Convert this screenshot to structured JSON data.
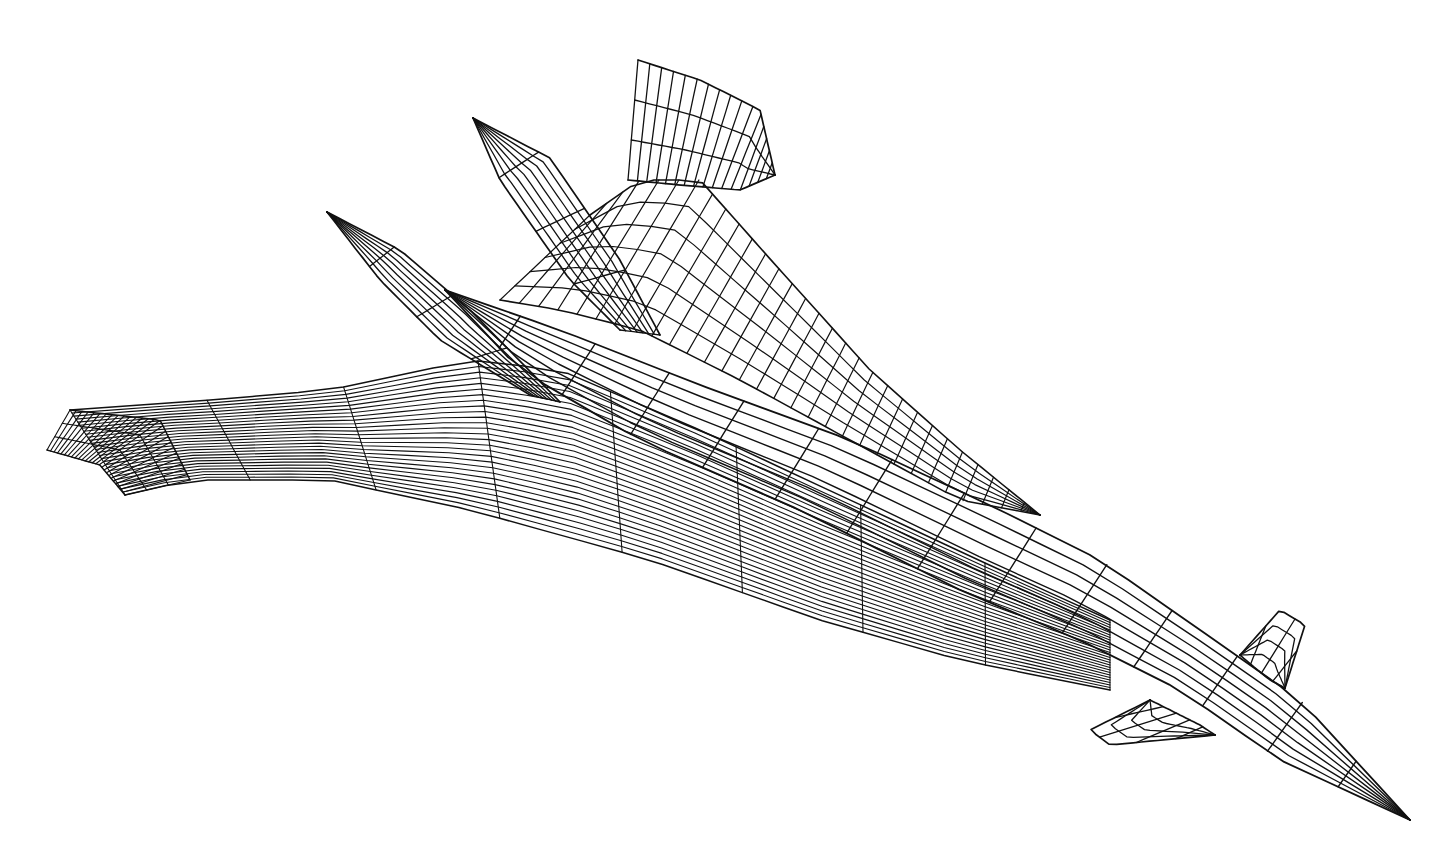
{
  "figure": {
    "background": "#ffffff",
    "stroke_color": "#111111",
    "stroke_width": 1.6,
    "fine_stroke_width": 1.1
  },
  "components": [
    {
      "id": "fuselage",
      "name": "fuselage-mesh",
      "u_lines": 14,
      "v_lines": 7,
      "edgeA": [
        [
          445,
          290
        ],
        [
          560,
          330
        ],
        [
          700,
          385
        ],
        [
          850,
          440
        ],
        [
          1000,
          510
        ],
        [
          1100,
          560
        ],
        [
          1200,
          630
        ],
        [
          1300,
          700
        ],
        [
          1410,
          820
        ]
      ],
      "edgeB": [
        [
          445,
          290
        ],
        [
          520,
          370
        ],
        [
          640,
          440
        ],
        [
          800,
          510
        ],
        [
          960,
          590
        ],
        [
          1080,
          640
        ],
        [
          1180,
          690
        ],
        [
          1280,
          760
        ],
        [
          1410,
          820
        ]
      ],
      "width": 1.4
    },
    {
      "id": "left-wing",
      "name": "left-wing-mesh",
      "u_lines": 8,
      "v_lines": 28,
      "edgeA": [
        [
          70,
          410
        ],
        [
          210,
          400
        ],
        [
          330,
          390
        ],
        [
          470,
          360
        ],
        [
          560,
          370
        ],
        [
          700,
          430
        ],
        [
          850,
          500
        ],
        [
          1000,
          570
        ],
        [
          1110,
          620
        ]
      ],
      "edgeB": [
        [
          125,
          495
        ],
        [
          190,
          480
        ],
        [
          330,
          480
        ],
        [
          470,
          510
        ],
        [
          650,
          560
        ],
        [
          820,
          620
        ],
        [
          960,
          660
        ],
        [
          1060,
          680
        ],
        [
          1110,
          690
        ]
      ],
      "width": 1.1
    },
    {
      "id": "wingtip",
      "name": "left-wingtip-mesh",
      "u_lines": 26,
      "v_lines": 3,
      "edgeA": [
        [
          70,
          410
        ],
        [
          160,
          420
        ],
        [
          190,
          480
        ]
      ],
      "edgeB": [
        [
          47,
          450
        ],
        [
          100,
          465
        ],
        [
          125,
          495
        ]
      ],
      "width": 1.1
    },
    {
      "id": "right-wing",
      "name": "right-wing-mesh",
      "u_lines": 30,
      "v_lines": 6,
      "edgeA": [
        [
          590,
          215
        ],
        [
          640,
          180
        ],
        [
          700,
          180
        ],
        [
          780,
          270
        ],
        [
          870,
          370
        ],
        [
          960,
          450
        ],
        [
          1040,
          515
        ]
      ],
      "edgeB": [
        [
          500,
          300
        ],
        [
          560,
          310
        ],
        [
          640,
          330
        ],
        [
          740,
          380
        ],
        [
          850,
          440
        ],
        [
          960,
          500
        ],
        [
          1040,
          515
        ]
      ],
      "width": 1.2
    },
    {
      "id": "vertical-fin",
      "name": "vertical-fin-mesh",
      "u_lines": 16,
      "v_lines": 3,
      "edgeA": [
        [
          638,
          60
        ],
        [
          700,
          80
        ],
        [
          760,
          110
        ],
        [
          775,
          175
        ]
      ],
      "edgeB": [
        [
          628,
          180
        ],
        [
          680,
          185
        ],
        [
          740,
          190
        ],
        [
          775,
          175
        ]
      ],
      "width": 1.3
    },
    {
      "id": "canard-1",
      "name": "upper-canard-mesh",
      "u_lines": 4,
      "v_lines": 7,
      "edgeA": [
        [
          473,
          118
        ],
        [
          550,
          158
        ],
        [
          620,
          260
        ],
        [
          660,
          335
        ]
      ],
      "edgeB": [
        [
          473,
          118
        ],
        [
          500,
          180
        ],
        [
          570,
          280
        ],
        [
          620,
          330
        ]
      ],
      "width": 1.3
    },
    {
      "id": "canard-2",
      "name": "lower-canard-mesh",
      "u_lines": 4,
      "v_lines": 7,
      "edgeA": [
        [
          327,
          212
        ],
        [
          400,
          250
        ],
        [
          470,
          310
        ],
        [
          560,
          402
        ]
      ],
      "edgeB": [
        [
          327,
          212
        ],
        [
          380,
          280
        ],
        [
          440,
          340
        ],
        [
          530,
          395
        ]
      ],
      "width": 1.3
    },
    {
      "id": "tail-fin",
      "name": "nose-dorsal-fin-mesh",
      "u_lines": 4,
      "v_lines": 4,
      "edgeA": [
        [
          1240,
          655
        ],
        [
          1280,
          610
        ],
        [
          1305,
          625
        ],
        [
          1285,
          688
        ]
      ],
      "edgeB": [
        [
          1240,
          655
        ],
        [
          1255,
          668
        ],
        [
          1270,
          680
        ],
        [
          1285,
          688
        ]
      ],
      "width": 1.3
    },
    {
      "id": "tail-plane",
      "name": "nose-ventral-canard-mesh",
      "u_lines": 5,
      "v_lines": 4,
      "edgeA": [
        [
          1150,
          700
        ],
        [
          1090,
          730
        ],
        [
          1110,
          745
        ],
        [
          1215,
          735
        ]
      ],
      "edgeB": [
        [
          1150,
          700
        ],
        [
          1180,
          715
        ],
        [
          1200,
          725
        ],
        [
          1215,
          735
        ]
      ],
      "width": 1.3
    }
  ]
}
